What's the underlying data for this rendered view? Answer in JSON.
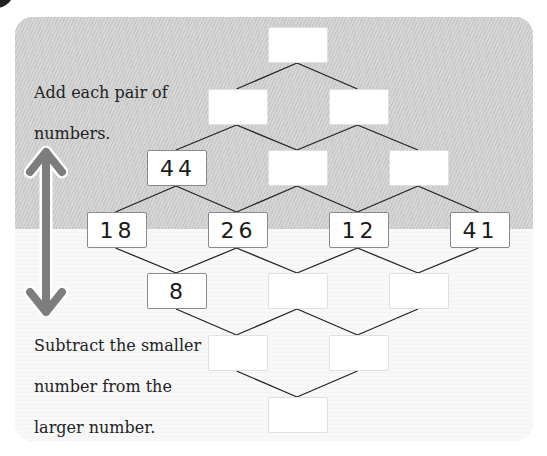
{
  "instructions": {
    "add": [
      "Add each pair of",
      "numbers."
    ],
    "subtract": [
      "Subtract the smaller",
      "number from the",
      "larger number."
    ]
  },
  "icons": {
    "arrow": "double-headed-vertical-arrow",
    "badge": "corner-badge"
  },
  "colors": {
    "shaded_region": "#cdcdcd",
    "light_region": "#f7f7f7",
    "line": "#222222",
    "arrow": "#808080"
  },
  "pyramid": {
    "rows": [
      [
        ""
      ],
      [
        "",
        ""
      ],
      [
        "44",
        "",
        ""
      ],
      [
        "18",
        "26",
        "12",
        "41"
      ],
      [
        "8",
        "",
        ""
      ],
      [
        "",
        ""
      ],
      [
        ""
      ]
    ]
  }
}
